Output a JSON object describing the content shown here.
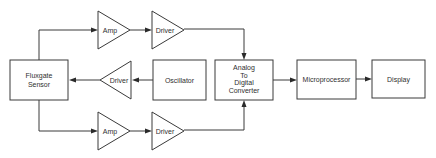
{
  "diagram": {
    "type": "block-diagram",
    "colors": {
      "stroke": "#3a3a3a",
      "text": "#2f2f2f",
      "background": "#ffffff"
    },
    "nodes": {
      "sensor": {
        "shape": "rect",
        "lines": [
          "Fluxgate",
          "Sensor"
        ]
      },
      "amp_top": {
        "shape": "triangle-right",
        "label": "Amp"
      },
      "driver_top": {
        "shape": "triangle-right",
        "label": "Driver"
      },
      "driver_mid": {
        "shape": "triangle-left",
        "label": "Driver"
      },
      "oscillator": {
        "shape": "rect",
        "label": "Oscillator"
      },
      "adc": {
        "shape": "rect",
        "lines": [
          "Analog",
          "To",
          "Digital",
          "Converter"
        ]
      },
      "microprocessor": {
        "shape": "rect",
        "label": "Microprocessor"
      },
      "display": {
        "shape": "rect",
        "label": "Display"
      },
      "amp_bottom": {
        "shape": "triangle-right",
        "label": "Amp"
      },
      "driver_bottom": {
        "shape": "triangle-right",
        "label": "Driver"
      }
    },
    "edges": [
      {
        "from": "sensor",
        "to": "amp_top"
      },
      {
        "from": "amp_top",
        "to": "driver_top"
      },
      {
        "from": "driver_top",
        "to": "adc"
      },
      {
        "from": "oscillator",
        "to": "driver_mid"
      },
      {
        "from": "driver_mid",
        "to": "sensor"
      },
      {
        "from": "sensor",
        "to": "amp_bottom"
      },
      {
        "from": "amp_bottom",
        "to": "driver_bottom"
      },
      {
        "from": "driver_bottom",
        "to": "adc"
      },
      {
        "from": "adc",
        "to": "microprocessor"
      },
      {
        "from": "microprocessor",
        "to": "display"
      }
    ]
  }
}
